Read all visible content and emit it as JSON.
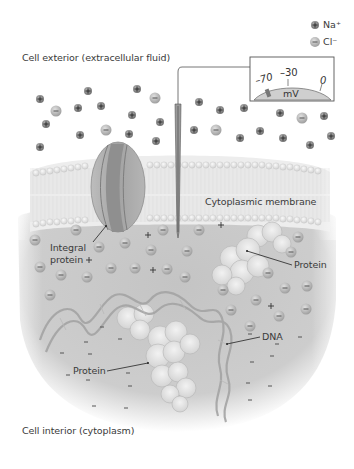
{
  "labels": {
    "exterior": "Cell exterior (extracellular fluid)",
    "interior": "Cell interior (cytoplasm)",
    "membrane": "Cytoplasmic membrane",
    "integral_protein_line1": "Integral",
    "integral_protein_line2": "protein",
    "protein_right": "Protein",
    "protein_bottom": "Protein",
    "dna": "DNA"
  },
  "legend": {
    "na": "Na⁺",
    "cl": "Cl⁻"
  },
  "meter": {
    "tick_left": "–70",
    "tick_mid": "–30",
    "tick_right": "0",
    "unit": "mV",
    "reading": "-70"
  },
  "colors": {
    "cytoplasm": "#c9c9c9",
    "membrane_head": "#e6e6e6",
    "membrane_tail": "#eeeeee",
    "protein_channel": "#a9a9a9",
    "cl_ion": "#b5b5b5",
    "na_ion": "#8a8a8a",
    "text": "#3a3a3a"
  }
}
